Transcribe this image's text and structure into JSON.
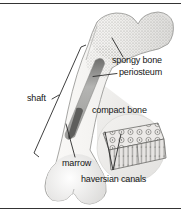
{
  "figure": {
    "type": "anatomical-diagram",
    "labels": {
      "spongy_bone": "spongy bone",
      "periosteum": "periosteum",
      "shaft": "shaft",
      "compact_bone": "compact bone",
      "marrow": "marrow",
      "haversian_canals": "haversian canals"
    }
  },
  "colors": {
    "background": "#ffffff",
    "rule": "#343434",
    "label_text": "#151515",
    "leader_line": "#2a2a2a",
    "bone_fill_light": "#fbfaf8",
    "bone_fill_dark": "#e0dfdd",
    "bone_outline": "#8f8f8d",
    "spongy_stipple": "#9d9d9b",
    "cavity_gray": "#8a8a88",
    "marrow_dark": "#5e5e5c",
    "inset_texture": "#787876"
  }
}
